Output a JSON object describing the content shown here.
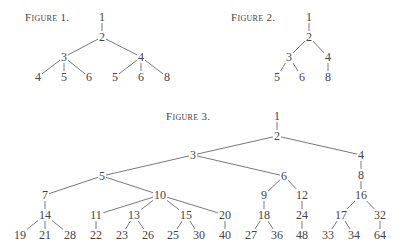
{
  "figures": [
    {
      "label": "Figure 1.",
      "label_pos": [
        25,
        11
      ],
      "nodes": [
        {
          "id": "a1",
          "text": "1",
          "x": 102,
          "y": 17
        },
        {
          "id": "a2",
          "text": "2",
          "x": 102,
          "y": 37
        },
        {
          "id": "a3",
          "text": "3",
          "x": 64,
          "y": 57
        },
        {
          "id": "a4",
          "text": "4",
          "x": 141,
          "y": 57
        },
        {
          "id": "a5",
          "text": "4",
          "x": 38,
          "y": 77
        },
        {
          "id": "a6",
          "text": "5",
          "x": 64,
          "y": 77
        },
        {
          "id": "a7",
          "text": "6",
          "x": 89,
          "y": 77
        },
        {
          "id": "a8",
          "text": "5",
          "x": 115,
          "y": 77
        },
        {
          "id": "a9",
          "text": "6",
          "x": 141,
          "y": 77
        },
        {
          "id": "a10",
          "text": "8",
          "x": 167,
          "y": 77
        }
      ],
      "edges": [
        [
          "a1",
          "a2"
        ],
        [
          "a2",
          "a3"
        ],
        [
          "a2",
          "a4"
        ],
        [
          "a3",
          "a5"
        ],
        [
          "a3",
          "a6"
        ],
        [
          "a3",
          "a7"
        ],
        [
          "a4",
          "a8"
        ],
        [
          "a4",
          "a9"
        ],
        [
          "a4",
          "a10"
        ]
      ]
    },
    {
      "label": "Figure 2.",
      "label_pos": [
        231,
        11
      ],
      "nodes": [
        {
          "id": "b1",
          "text": "1",
          "x": 309,
          "y": 17
        },
        {
          "id": "b2",
          "text": "2",
          "x": 309,
          "y": 37
        },
        {
          "id": "b3",
          "text": "3",
          "x": 289,
          "y": 57
        },
        {
          "id": "b4",
          "text": "4",
          "x": 328,
          "y": 57
        },
        {
          "id": "b5",
          "text": "5",
          "x": 277,
          "y": 77
        },
        {
          "id": "b6",
          "text": "6",
          "x": 302,
          "y": 77
        },
        {
          "id": "b7",
          "text": "8",
          "x": 328,
          "y": 77
        }
      ],
      "edges": [
        [
          "b1",
          "b2"
        ],
        [
          "b2",
          "b3"
        ],
        [
          "b2",
          "b4"
        ],
        [
          "b3",
          "b5"
        ],
        [
          "b3",
          "b6"
        ],
        [
          "b4",
          "b7"
        ]
      ]
    },
    {
      "label": "Figure 3.",
      "label_pos": [
        166,
        110
      ],
      "nodes": [
        {
          "id": "c1",
          "text": "1",
          "x": 277,
          "y": 116
        },
        {
          "id": "c2",
          "text": "2",
          "x": 277,
          "y": 136
        },
        {
          "id": "c3",
          "text": "3",
          "x": 193,
          "y": 155
        },
        {
          "id": "c4",
          "text": "4",
          "x": 361,
          "y": 155
        },
        {
          "id": "c5",
          "text": "5",
          "x": 102,
          "y": 176
        },
        {
          "id": "c6",
          "text": "6",
          "x": 284,
          "y": 176
        },
        {
          "id": "c8",
          "text": "8",
          "x": 361,
          "y": 175
        },
        {
          "id": "c7",
          "text": "7",
          "x": 45,
          "y": 195
        },
        {
          "id": "c10",
          "text": "10",
          "x": 160,
          "y": 195
        },
        {
          "id": "c9",
          "text": "9",
          "x": 264,
          "y": 195
        },
        {
          "id": "c12",
          "text": "12",
          "x": 302,
          "y": 195
        },
        {
          "id": "c16",
          "text": "16",
          "x": 361,
          "y": 195
        },
        {
          "id": "c14",
          "text": "14",
          "x": 45,
          "y": 215
        },
        {
          "id": "c11",
          "text": "11",
          "x": 96,
          "y": 215
        },
        {
          "id": "c13",
          "text": "13",
          "x": 134,
          "y": 215
        },
        {
          "id": "c15",
          "text": "15",
          "x": 186,
          "y": 215
        },
        {
          "id": "c20",
          "text": "20",
          "x": 225,
          "y": 215
        },
        {
          "id": "c18",
          "text": "18",
          "x": 264,
          "y": 215
        },
        {
          "id": "c24",
          "text": "24",
          "x": 302,
          "y": 215
        },
        {
          "id": "c17",
          "text": "17",
          "x": 341,
          "y": 215
        },
        {
          "id": "c32",
          "text": "32",
          "x": 380,
          "y": 215
        },
        {
          "id": "c19",
          "text": "19",
          "x": 20,
          "y": 235
        },
        {
          "id": "c21",
          "text": "21",
          "x": 45,
          "y": 235
        },
        {
          "id": "c28",
          "text": "28",
          "x": 70,
          "y": 235
        },
        {
          "id": "c22",
          "text": "22",
          "x": 96,
          "y": 235
        },
        {
          "id": "c23",
          "text": "23",
          "x": 122,
          "y": 235
        },
        {
          "id": "c26",
          "text": "26",
          "x": 148,
          "y": 235
        },
        {
          "id": "c25",
          "text": "25",
          "x": 173,
          "y": 235
        },
        {
          "id": "c30",
          "text": "30",
          "x": 199,
          "y": 235
        },
        {
          "id": "c40",
          "text": "40",
          "x": 225,
          "y": 235
        },
        {
          "id": "c27",
          "text": "27",
          "x": 251,
          "y": 235
        },
        {
          "id": "c36",
          "text": "36",
          "x": 277,
          "y": 235
        },
        {
          "id": "c48",
          "text": "48",
          "x": 302,
          "y": 235
        },
        {
          "id": "c33",
          "text": "33",
          "x": 328,
          "y": 235
        },
        {
          "id": "c34",
          "text": "34",
          "x": 354,
          "y": 235
        },
        {
          "id": "c64",
          "text": "64",
          "x": 380,
          "y": 235
        }
      ],
      "edges": [
        [
          "c1",
          "c2"
        ],
        [
          "c2",
          "c3"
        ],
        [
          "c2",
          "c4"
        ],
        [
          "c3",
          "c5"
        ],
        [
          "c3",
          "c6"
        ],
        [
          "c4",
          "c8"
        ],
        [
          "c8",
          "c16"
        ],
        [
          "c5",
          "c7"
        ],
        [
          "c5",
          "c10"
        ],
        [
          "c7",
          "c14"
        ],
        [
          "c14",
          "c19"
        ],
        [
          "c14",
          "c21"
        ],
        [
          "c14",
          "c28"
        ],
        [
          "c10",
          "c11"
        ],
        [
          "c10",
          "c13"
        ],
        [
          "c10",
          "c15"
        ],
        [
          "c10",
          "c20"
        ],
        [
          "c11",
          "c22"
        ],
        [
          "c13",
          "c23"
        ],
        [
          "c13",
          "c26"
        ],
        [
          "c15",
          "c25"
        ],
        [
          "c15",
          "c30"
        ],
        [
          "c20",
          "c40"
        ],
        [
          "c6",
          "c9"
        ],
        [
          "c6",
          "c12"
        ],
        [
          "c9",
          "c18"
        ],
        [
          "c18",
          "c27"
        ],
        [
          "c18",
          "c36"
        ],
        [
          "c12",
          "c24"
        ],
        [
          "c24",
          "c48"
        ],
        [
          "c16",
          "c17"
        ],
        [
          "c16",
          "c32"
        ],
        [
          "c17",
          "c33"
        ],
        [
          "c17",
          "c34"
        ],
        [
          "c32",
          "c64"
        ]
      ]
    }
  ],
  "colors": {
    "line": "#555555",
    "text": "#444444",
    "background": "#ffffff"
  }
}
